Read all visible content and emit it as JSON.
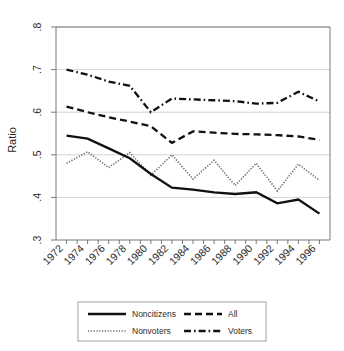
{
  "chart_data": {
    "type": "line",
    "title": "",
    "xlabel": "",
    "ylabel": "Ratio",
    "xlim": [
      1971,
      1997
    ],
    "ylim": [
      0.3,
      0.8
    ],
    "grid": true,
    "legend_position": "bottom",
    "x": [
      1972,
      1974,
      1976,
      1978,
      1980,
      1982,
      1984,
      1986,
      1988,
      1990,
      1992,
      1994,
      1996
    ],
    "xtick_labels": [
      "1972",
      "1974",
      "1976",
      "1978",
      "1980",
      "1982",
      "1984",
      "1986",
      "1988",
      "1990",
      "1992",
      "1994",
      "1996"
    ],
    "ytick_labels": [
      ".8",
      ".7",
      ".6",
      ".5",
      ".4",
      ".3"
    ],
    "ytick_values": [
      0.8,
      0.7,
      0.6,
      0.5,
      0.4,
      0.3
    ],
    "series": [
      {
        "name": "Noncitizens",
        "style": "solid",
        "values": [
          0.545,
          0.538,
          0.515,
          0.492,
          0.455,
          0.423,
          0.418,
          0.412,
          0.408,
          0.412,
          0.386,
          0.395,
          0.362
        ]
      },
      {
        "name": "All",
        "style": "dashed",
        "values": [
          0.613,
          0.6,
          0.588,
          0.578,
          0.567,
          0.528,
          0.555,
          0.552,
          0.549,
          0.548,
          0.546,
          0.543,
          0.535
        ]
      },
      {
        "name": "Nonvoters",
        "style": "dotted",
        "values": [
          0.48,
          0.507,
          0.47,
          0.505,
          0.452,
          0.5,
          0.443,
          0.487,
          0.428,
          0.48,
          0.415,
          0.478,
          0.44
        ]
      },
      {
        "name": "Voters",
        "style": "dash-dot",
        "values": [
          0.7,
          0.688,
          0.672,
          0.662,
          0.6,
          0.632,
          0.63,
          0.628,
          0.626,
          0.62,
          0.622,
          0.648,
          0.625
        ]
      }
    ]
  },
  "legend": {
    "entries": [
      {
        "label": "Noncitizens",
        "style": "solid"
      },
      {
        "label": "All",
        "style": "dashed"
      },
      {
        "label": "Nonvoters",
        "style": "dotted"
      },
      {
        "label": "Voters",
        "style": "dash-dot"
      }
    ]
  },
  "colors": {
    "line": "#111111",
    "grid": "#c8c8c8",
    "axis": "#6b6b6b",
    "text": "#2b2b2b",
    "background": "#ffffff"
  }
}
